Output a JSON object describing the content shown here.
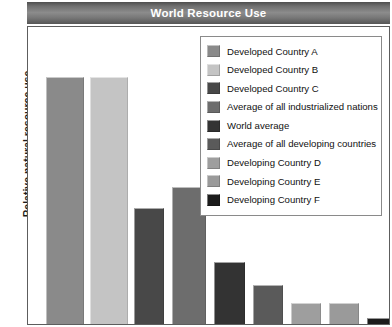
{
  "chart_data": {
    "type": "bar",
    "title": "World Resource Use",
    "xlabel": "",
    "ylabel": "Relative natural resource use",
    "grid": false,
    "legend_position": "top-right",
    "ylim": [
      0,
      100
    ],
    "categories": [
      "Developed Country A",
      "Developed Country B",
      "Developed Country C",
      "Average of all industrialized nations",
      "World average",
      "Average of all developing countries",
      "Developing Country D",
      "Developing Country E",
      "Developing Country F"
    ],
    "values": [
      83,
      83,
      39,
      46,
      21,
      13,
      7,
      7,
      2
    ],
    "colors": [
      "#8a8a8a",
      "#c4c4c4",
      "#484848",
      "#6d6d6d",
      "#333333",
      "#5a5a5a",
      "#9e9e9e",
      "#9a9a9a",
      "#1c1c1c"
    ]
  },
  "title": {
    "text": "World Resource Use"
  },
  "axis": {
    "ylabel": "Relative natural resource use"
  },
  "legend": {
    "items": [
      {
        "label": "Developed Country A",
        "color": "#8a8a8a"
      },
      {
        "label": "Developed Country B",
        "color": "#c4c4c4"
      },
      {
        "label": "Developed Country C",
        "color": "#484848"
      },
      {
        "label": "Average of all industrialized nations",
        "color": "#6d6d6d"
      },
      {
        "label": "World average",
        "color": "#333333"
      },
      {
        "label": "Average of all developing countries",
        "color": "#5a5a5a"
      },
      {
        "label": "Developing Country D",
        "color": "#9e9e9e"
      },
      {
        "label": "Developing Country E",
        "color": "#9a9a9a"
      },
      {
        "label": "Developing Country F",
        "color": "#1c1c1c"
      }
    ]
  }
}
